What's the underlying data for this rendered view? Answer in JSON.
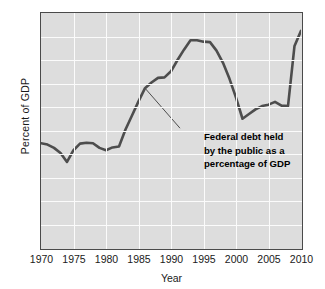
{
  "chart_data": {
    "type": "line",
    "title": "",
    "xlabel": "Year",
    "ylabel": "Percent of GDP",
    "xlim": [
      1970,
      2010
    ],
    "ylim": [
      0,
      50
    ],
    "grid": true,
    "legend": "none",
    "annotation": {
      "lines": [
        "Federal debt held",
        "by the public as a",
        "percentage of GDP"
      ],
      "points_to": {
        "x": 1986,
        "y": 34
      }
    },
    "xticks": [
      1970,
      1975,
      1980,
      1985,
      1990,
      1995,
      2000,
      2005,
      2010
    ],
    "xtick_labels": [
      "1970",
      "1975",
      "1980",
      "1985",
      "1990",
      "1995",
      "2000",
      "2005",
      "2010"
    ],
    "yticks": [
      0,
      5,
      10,
      15,
      20,
      25,
      30,
      35,
      40,
      45,
      50
    ],
    "ytick_labels": [
      "0",
      "5",
      "10",
      "15",
      "20",
      "25",
      "30",
      "35",
      "40",
      "45",
      "50"
    ],
    "series": [
      {
        "name": "Federal debt held by the public as a percentage of GDP",
        "color": "#4d4d4d",
        "x": [
          1970,
          1971,
          1972,
          1973,
          1974,
          1975,
          1976,
          1977,
          1978,
          1979,
          1980,
          1981,
          1982,
          1983,
          1984,
          1985,
          1986,
          1987,
          1988,
          1989,
          1990,
          1991,
          1992,
          1993,
          1994,
          1995,
          1996,
          1997,
          1998,
          1999,
          2000,
          2001,
          2002,
          2003,
          2004,
          2005,
          2006,
          2007,
          2008,
          2009,
          2010
        ],
        "values": [
          22.3,
          22.0,
          21.3,
          20.2,
          18.3,
          20.8,
          22.2,
          22.4,
          22.3,
          21.3,
          20.8,
          21.4,
          21.6,
          25.2,
          28.2,
          31.2,
          34.0,
          35.2,
          36.2,
          36.3,
          37.6,
          40.0,
          42.2,
          44.2,
          44.2,
          43.9,
          43.8,
          42.0,
          39.4,
          36.0,
          32.0,
          27.5,
          28.5,
          29.5,
          30.2,
          30.5,
          31.1,
          30.3,
          30.2,
          43.0,
          46.2
        ]
      }
    ]
  },
  "figure": {
    "background": "#ffffff",
    "plot_background": "#dddddd",
    "gridline_color": "#fbfbfb",
    "border_color": "#4a4a4a",
    "line_color": "#4d4d4d",
    "text_color": "#1a1a1a"
  }
}
